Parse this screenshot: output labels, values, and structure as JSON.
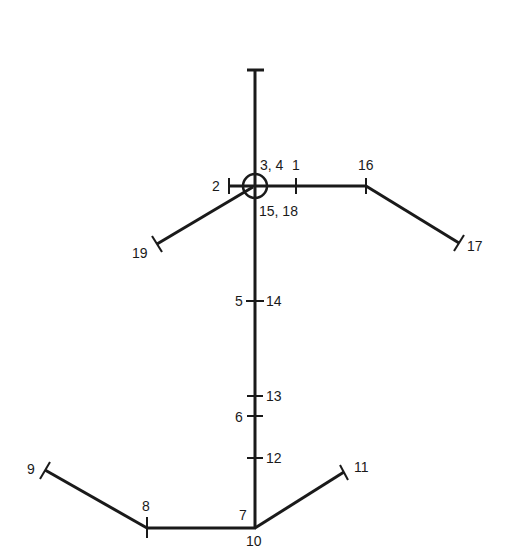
{
  "diagram": {
    "type": "stick-figure-landmark-diagram",
    "labels": {
      "p1": "1",
      "p2": "2",
      "p3_4": "3, 4",
      "p5": "5",
      "p6": "6",
      "p7": "7",
      "p8": "8",
      "p9": "9",
      "p10": "10",
      "p11": "11",
      "p12": "12",
      "p13": "13",
      "p14": "14",
      "p15_18": "15, 18",
      "p16": "16",
      "p17": "17",
      "p19": "19"
    },
    "colors": {
      "line": "#1a1a1a",
      "background": "#ffffff"
    }
  }
}
